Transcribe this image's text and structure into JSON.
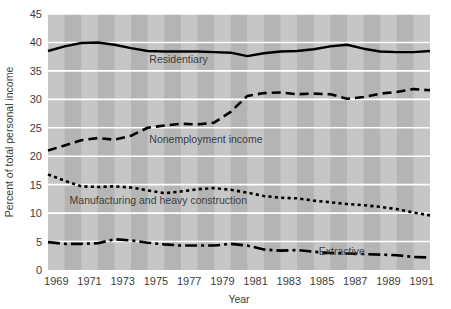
{
  "chart_data": {
    "type": "line",
    "title": "",
    "xlabel": "Year",
    "ylabel": "Percent of total personal income",
    "xlim": [
      1969,
      1992
    ],
    "ylim": [
      0,
      45
    ],
    "grid": true,
    "grid_color": "#ffffff",
    "plot_background": "#b4b4b4",
    "plot_band_color": "#c6c6c6",
    "legend_position": "inline-labels",
    "ytick_labels": [
      "0",
      "5",
      "10",
      "15",
      "20",
      "25",
      "30",
      "35",
      "40",
      "45"
    ],
    "ytick_values": [
      0,
      5,
      10,
      15,
      20,
      25,
      30,
      35,
      40,
      45
    ],
    "xtick_labels": [
      "1969",
      "1971",
      "1973",
      "1975",
      "1977",
      "1979",
      "1981",
      "1983",
      "1985",
      "1987",
      "1989",
      "1991"
    ],
    "xtick_values": [
      1969,
      1971,
      1973,
      1975,
      1977,
      1979,
      1981,
      1983,
      1985,
      1987,
      1989,
      1991
    ],
    "x": [
      1969,
      1970,
      1971,
      1972,
      1973,
      1974,
      1975,
      1976,
      1977,
      1978,
      1979,
      1980,
      1981,
      1982,
      1983,
      1984,
      1985,
      1986,
      1987,
      1988,
      1989,
      1990,
      1991,
      1992
    ],
    "series": [
      {
        "name": "Residentiary",
        "dash_style": "solid",
        "color": "#000000",
        "label_x": 1975.1,
        "label_y": 36.3,
        "values": [
          38.5,
          39.3,
          39.9,
          40.0,
          39.6,
          39.0,
          38.5,
          38.4,
          38.4,
          38.4,
          38.3,
          38.2,
          37.6,
          38.1,
          38.4,
          38.5,
          38.8,
          39.3,
          39.6,
          38.9,
          38.4,
          38.3,
          38.3,
          38.5
        ]
      },
      {
        "name": "Nonemployment income",
        "dash_style": "dashed",
        "color": "#000000",
        "label_x": 1975.1,
        "label_y": 22.4,
        "values": [
          21.0,
          21.9,
          22.8,
          23.2,
          22.9,
          23.6,
          25.0,
          25.4,
          25.7,
          25.6,
          25.9,
          27.8,
          30.6,
          31.1,
          31.2,
          30.9,
          31.0,
          30.9,
          30.1,
          30.4,
          31.0,
          31.3,
          31.8,
          31.6
        ]
      },
      {
        "name": "Manufacturing and heavy construction",
        "dash_style": "dotted",
        "color": "#000000",
        "label_x": 1970.3,
        "label_y": 11.6,
        "values": [
          16.8,
          15.7,
          14.7,
          14.6,
          14.7,
          14.5,
          14.0,
          13.5,
          13.8,
          14.2,
          14.4,
          14.1,
          13.6,
          13.0,
          12.7,
          12.6,
          12.2,
          11.9,
          11.6,
          11.4,
          11.1,
          10.7,
          10.1,
          9.6
        ]
      },
      {
        "name": "Extractive",
        "dash_style": "dashdot",
        "color": "#000000",
        "label_x": 1985.3,
        "label_y": 2.7,
        "values": [
          4.9,
          4.6,
          4.6,
          4.7,
          5.4,
          5.2,
          4.8,
          4.5,
          4.3,
          4.3,
          4.3,
          4.6,
          4.3,
          3.6,
          3.4,
          3.5,
          3.2,
          3.0,
          2.9,
          2.8,
          2.7,
          2.6,
          2.3,
          2.2
        ]
      }
    ]
  },
  "figure": {
    "xlabel": "Year",
    "ylabel": "Percent of total personal income"
  }
}
